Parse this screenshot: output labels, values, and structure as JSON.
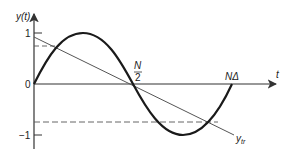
{
  "figure": {
    "y_axis_label": "y(t)",
    "x_axis_label": "t",
    "tick_one": "1",
    "tick_zero": "0",
    "tick_minus_one": "−1",
    "half_label_num": "N",
    "half_label_den": "2",
    "end_label": "NΔ",
    "trend_label_main": "y",
    "trend_label_sub": "tr"
  },
  "colors": {
    "curve": "#1a1a1a",
    "line": "#555555",
    "axis": "#333333"
  }
}
